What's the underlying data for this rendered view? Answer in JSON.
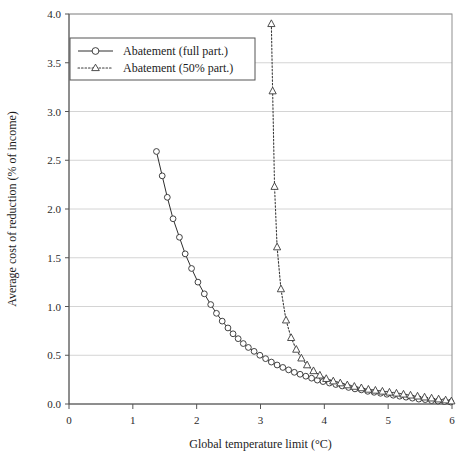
{
  "chart_data": {
    "type": "line",
    "title": "",
    "xlabel": "Global temperature limit (°C)",
    "ylabel": "Average cost of reduction (% of income)",
    "xlim": [
      0,
      6
    ],
    "ylim": [
      0.0,
      4.0
    ],
    "xticks": [
      0,
      1,
      2,
      3,
      4,
      5,
      6
    ],
    "xtick_labels": [
      "0",
      "1",
      "2",
      "3",
      "4",
      "5",
      "6"
    ],
    "yticks": [
      0.0,
      0.5,
      1.0,
      1.5,
      2.0,
      2.5,
      3.0,
      3.5,
      4.0
    ],
    "ytick_labels": [
      "0.0",
      "0.5",
      "1.0",
      "1.5",
      "2.0",
      "2.5",
      "3.0",
      "3.5",
      "4.0"
    ],
    "grid": "horizontal",
    "legend_position": "top-left-inside",
    "series": [
      {
        "name": "Abatement (full part.)",
        "marker": "circle",
        "linestyle": "solid",
        "color": "#2e2e2e",
        "points": [
          [
            1.37,
            2.59
          ],
          [
            1.46,
            2.34
          ],
          [
            1.54,
            2.12
          ],
          [
            1.63,
            1.9
          ],
          [
            1.73,
            1.71
          ],
          [
            1.82,
            1.54
          ],
          [
            1.92,
            1.39
          ],
          [
            2.02,
            1.25
          ],
          [
            2.12,
            1.13
          ],
          [
            2.22,
            1.02
          ],
          [
            2.31,
            0.93
          ],
          [
            2.4,
            0.85
          ],
          [
            2.49,
            0.78
          ],
          [
            2.57,
            0.72
          ],
          [
            2.65,
            0.67
          ],
          [
            2.73,
            0.62
          ],
          [
            2.81,
            0.58
          ],
          [
            2.9,
            0.54
          ],
          [
            2.99,
            0.5
          ],
          [
            3.08,
            0.465
          ],
          [
            3.17,
            0.43
          ],
          [
            3.26,
            0.4
          ],
          [
            3.35,
            0.375
          ],
          [
            3.44,
            0.35
          ],
          [
            3.53,
            0.325
          ],
          [
            3.62,
            0.305
          ],
          [
            3.71,
            0.285
          ],
          [
            3.8,
            0.265
          ],
          [
            3.89,
            0.245
          ],
          [
            3.98,
            0.23
          ],
          [
            4.08,
            0.215
          ],
          [
            4.18,
            0.2
          ],
          [
            4.28,
            0.185
          ],
          [
            4.38,
            0.17
          ],
          [
            4.48,
            0.155
          ],
          [
            4.58,
            0.145
          ],
          [
            4.68,
            0.13
          ],
          [
            4.78,
            0.12
          ],
          [
            4.88,
            0.11
          ],
          [
            4.98,
            0.1
          ],
          [
            5.08,
            0.09
          ],
          [
            5.18,
            0.08
          ],
          [
            5.28,
            0.07
          ],
          [
            5.38,
            0.06
          ],
          [
            5.48,
            0.05
          ],
          [
            5.58,
            0.045
          ],
          [
            5.68,
            0.035
          ],
          [
            5.78,
            0.03
          ],
          [
            5.88,
            0.025
          ],
          [
            5.98,
            0.02
          ]
        ]
      },
      {
        "name": "Abatement (50% part.)",
        "marker": "triangle",
        "linestyle": "dotted",
        "color": "#3a3a3a",
        "points": [
          [
            3.17,
            3.9
          ],
          [
            3.19,
            3.21
          ],
          [
            3.22,
            2.23
          ],
          [
            3.26,
            1.61
          ],
          [
            3.32,
            1.18
          ],
          [
            3.4,
            0.86
          ],
          [
            3.48,
            0.68
          ],
          [
            3.56,
            0.56
          ],
          [
            3.64,
            0.47
          ],
          [
            3.73,
            0.4
          ],
          [
            3.83,
            0.34
          ],
          [
            3.93,
            0.295
          ],
          [
            4.03,
            0.26
          ],
          [
            4.14,
            0.235
          ],
          [
            4.25,
            0.215
          ],
          [
            4.36,
            0.195
          ],
          [
            4.47,
            0.18
          ],
          [
            4.58,
            0.165
          ],
          [
            4.69,
            0.15
          ],
          [
            4.8,
            0.14
          ],
          [
            4.91,
            0.13
          ],
          [
            5.02,
            0.12
          ],
          [
            5.13,
            0.11
          ],
          [
            5.24,
            0.1
          ],
          [
            5.35,
            0.09
          ],
          [
            5.46,
            0.08
          ],
          [
            5.57,
            0.07
          ],
          [
            5.68,
            0.06
          ],
          [
            5.79,
            0.05
          ],
          [
            5.9,
            0.04
          ],
          [
            5.99,
            0.03
          ]
        ]
      }
    ]
  },
  "legend": {
    "entries": [
      {
        "label": "Abatement (full part.)"
      },
      {
        "label": "Abatement (50% part.)"
      }
    ]
  }
}
